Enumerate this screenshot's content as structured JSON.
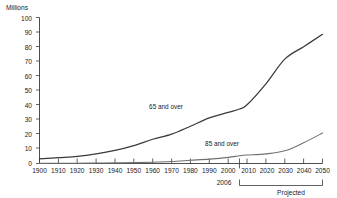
{
  "chart_data": {
    "type": "line",
    "title": "",
    "subtitle": "",
    "xlabel": "",
    "ylabel": "Millions",
    "ylim": [
      0,
      100
    ],
    "xlim": [
      1900,
      2050
    ],
    "grid": false,
    "legend_position": "inline-labels",
    "y_ticks": [
      "0",
      "10",
      "20",
      "30",
      "40",
      "50",
      "60",
      "70",
      "80",
      "90",
      "100"
    ],
    "x_ticks": [
      "1900",
      "1910",
      "1920",
      "1930",
      "1940",
      "1950",
      "1960",
      "1970",
      "1980",
      "1990",
      "2000",
      "2010",
      "2020",
      "2030",
      "2040",
      "2050"
    ],
    "x": [
      1900,
      1910,
      1920,
      1930,
      1940,
      1950,
      1960,
      1970,
      1980,
      1990,
      2000,
      2006,
      2010,
      2020,
      2030,
      2040,
      2050
    ],
    "series": [
      {
        "name": "65 and over",
        "label": "65 and over",
        "color": "#3a3a3a",
        "values": [
          3.1,
          4.0,
          4.9,
          6.6,
          9.0,
          12.3,
          16.6,
          20.1,
          25.5,
          31.2,
          35.0,
          37.3,
          40.2,
          54.6,
          71.5,
          80.0,
          88.5
        ]
      },
      {
        "name": "85 and over",
        "label": "85 and over",
        "color": "#707070",
        "values": [
          0.1,
          0.2,
          0.2,
          0.3,
          0.4,
          0.6,
          0.9,
          1.4,
          2.2,
          3.0,
          4.2,
          5.3,
          5.8,
          6.6,
          8.7,
          14.2,
          20.9
        ]
      }
    ],
    "annotations": [
      {
        "name": "projection-start-year",
        "text": "2006",
        "at_x": 2006
      },
      {
        "name": "projected-bracket-label",
        "text": "Projected",
        "from_x": 2006,
        "to_x": 2050
      }
    ]
  },
  "labels": {
    "y_axis_title": "Millions",
    "series_65": "65 and over",
    "series_85": "85 and over",
    "projection_year": "2006",
    "projected": "Projected"
  },
  "ticks": {
    "y": [
      "100",
      "90",
      "80",
      "70",
      "60",
      "50",
      "40",
      "30",
      "20",
      "10",
      "0"
    ],
    "x": [
      "1900",
      "1910",
      "1920",
      "1930",
      "1940",
      "1950",
      "1960",
      "1970",
      "1980",
      "1990",
      "2000",
      "2010",
      "2020",
      "2030",
      "2040",
      "2050"
    ]
  },
  "colors": {
    "axis": "#3a3a3a",
    "series_65": "#3a3a3a",
    "series_85": "#707070",
    "background": "#ffffff"
  }
}
